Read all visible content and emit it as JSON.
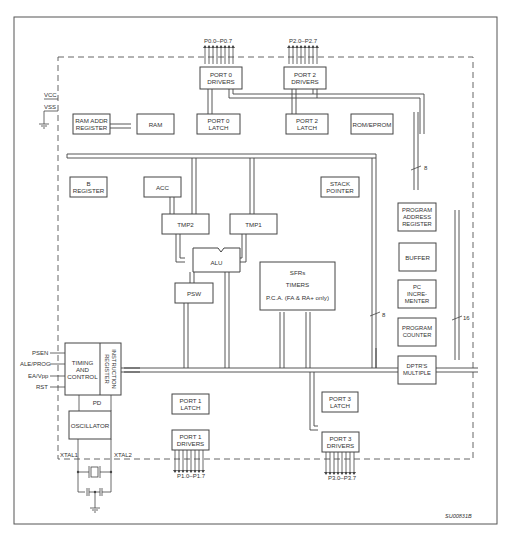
{
  "diagram": {
    "figure_id": "SU00831B",
    "power": {
      "vcc": "VCC",
      "vss": "VSS"
    },
    "ports": {
      "p0_pins": "P0.0–P0.7",
      "p2_pins": "P2.0–P2.7",
      "p1_pins": "P1.0–P1.7",
      "p3_pins": "P3.0–P3.7"
    },
    "blocks": {
      "port0_drivers": "PORT 0\nDRIVERS",
      "port2_drivers": "PORT 2\nDRIVERS",
      "ram_addr_register": "RAM ADDR\nREGISTER",
      "ram": "RAM",
      "port0_latch": "PORT 0\nLATCH",
      "port2_latch": "PORT 2\nLATCH",
      "rom_eprom": "ROM/EPROM",
      "b_register": "B\nREGISTER",
      "acc": "ACC",
      "stack_pointer": "STACK\nPOINTER",
      "tmp2": "TMP2",
      "tmp1": "TMP1",
      "alu": "ALU",
      "psw": "PSW",
      "sfrs": "SFRs",
      "timers": "TIMERS",
      "pca": "P.C.A. (FA & RA+ only)",
      "program_address_register": "PROGRAM\nADDRESS\nREGISTER",
      "buffer": "BUFFER",
      "pc_incrementer": "PC\nINCRE-\nMENTER",
      "program_counter": "PROGRAM\nCOUNTER",
      "dptrs_multiple": "DPTR'S\nMULTIPLE",
      "timing_and_control": "TIMING\nAND\nCONTROL",
      "instruction_register": "INSTRUCTION\nREGISTER",
      "pd": "PD",
      "oscillator": "OSCILLATOR",
      "port1_latch": "PORT 1\nLATCH",
      "port1_drivers": "PORT 1\nDRIVERS",
      "port3_latch": "PORT 3\nLATCH",
      "port3_drivers": "PORT 3\nDRIVERS"
    },
    "control_pins": [
      "PSEN",
      "ALE/PROG",
      "EA/Vpp",
      "RST"
    ],
    "xtal": {
      "xtal1": "XTAL1",
      "xtal2": "XTAL2"
    },
    "bus_widths": {
      "rom_addr": "8",
      "sfr_bus": "8",
      "pc_bus": "16"
    },
    "colors": {
      "line": "#444444",
      "box_fill": "#ffffff",
      "background": "#ffffff"
    }
  }
}
